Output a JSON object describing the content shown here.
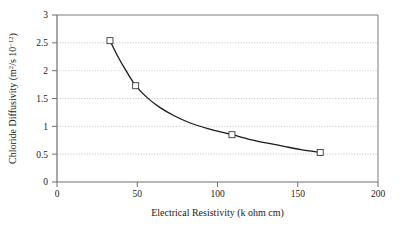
{
  "chart_data": {
    "type": "scatter",
    "title": "",
    "xlabel": "Electrical Resistivity (k ohm cm)",
    "ylabel": "Chloride Diffusivity (m2/s 10-12)",
    "ylabel_parts": {
      "main": "Chloride Diffusivity (m",
      "sup1": "2",
      "mid": "/s 10",
      "sup2": "−12",
      "tail": ")"
    },
    "xlim": [
      0,
      200
    ],
    "ylim": [
      0,
      3
    ],
    "xticks": [
      0,
      50,
      100,
      150,
      200
    ],
    "xtick_labels": [
      "0",
      "50",
      "100",
      "150",
      "200"
    ],
    "yticks": [
      0,
      0.5,
      1,
      1.5,
      2,
      2.5,
      3
    ],
    "ytick_labels": [
      "0",
      "0.5",
      "1",
      "1.5",
      "2",
      "2.5",
      "3"
    ],
    "grid": {
      "horizontal": true,
      "vertical": false,
      "style": "dotted",
      "color": "#b8b8b8"
    },
    "legend": {
      "visible": false,
      "position": "none"
    },
    "marker": {
      "shape": "open-square",
      "size": 6,
      "edge_color": "#3a3a3a",
      "face_color": "#ffffff"
    },
    "line": {
      "color": "#1a1a1a",
      "width": 1.3,
      "style": "solid",
      "description": "smooth decaying power-law fit through the four data points"
    },
    "x": [
      33,
      49,
      109,
      164
    ],
    "values": [
      2.54,
      1.73,
      0.85,
      0.53
    ],
    "points": [
      {
        "x": 33,
        "y": 2.54
      },
      {
        "x": 49,
        "y": 1.73
      },
      {
        "x": 109,
        "y": 0.85
      },
      {
        "x": 164,
        "y": 0.53
      }
    ],
    "series": [
      {
        "name": "Chloride diffusivity vs electrical resistivity",
        "x": [
          33,
          49,
          109,
          164
        ],
        "values": [
          2.54,
          1.73,
          0.85,
          0.53
        ]
      }
    ],
    "fit_curve": {
      "x": [
        33,
        38,
        43,
        49,
        56,
        64,
        73,
        83,
        94,
        109,
        124,
        140,
        152,
        164
      ],
      "y": [
        2.54,
        2.25,
        2.0,
        1.73,
        1.52,
        1.34,
        1.19,
        1.06,
        0.96,
        0.85,
        0.74,
        0.65,
        0.58,
        0.53
      ]
    },
    "frame": {
      "left_axis": true,
      "bottom_axis": true,
      "top_border": true,
      "right_border": true,
      "color": "#6f6f6f"
    }
  }
}
